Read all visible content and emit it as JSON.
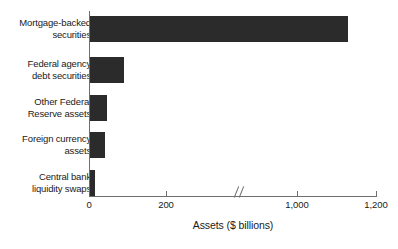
{
  "chart_data": {
    "type": "bar",
    "orientation": "horizontal",
    "title": "",
    "xlabel": "Assets ($ billions)",
    "ylabel": "",
    "categories": [
      "Mortgage-backed\nsecurities",
      "Federal agency\ndebt securities",
      "Other Federal\nReserve assets",
      "Foreign currency\nassets",
      "Central bank\nliquidity swaps"
    ],
    "values": [
      1130,
      70,
      45,
      40,
      10
    ],
    "xticks": [
      {
        "label": "0",
        "value": 0
      },
      {
        "label": "200",
        "value": 200
      },
      {
        "label": "1,000",
        "value": 1000
      },
      {
        "label": "1,200",
        "value": 1200
      }
    ],
    "xlim": [
      0,
      1200
    ],
    "axis_break": true,
    "axis_break_between": [
      200,
      1000
    ],
    "grid": false,
    "legend": null,
    "bar_color": "#2b2b2b",
    "axis_color": "#6e6e6e",
    "background_color": "#ffffff"
  },
  "layout": {
    "bar_pixels": [
      {
        "left": 90,
        "top": 16,
        "width": 258,
        "height": 26
      },
      {
        "left": 90,
        "top": 57,
        "width": 34,
        "height": 26
      },
      {
        "left": 90,
        "top": 95,
        "width": 17,
        "height": 26
      },
      {
        "left": 90,
        "top": 132,
        "width": 15,
        "height": 26
      },
      {
        "left": 90,
        "top": 170,
        "width": 5,
        "height": 26
      }
    ],
    "label_tops": [
      16,
      57,
      95,
      132,
      170
    ],
    "tick_pixels": [
      89,
      166,
      297,
      376
    ]
  }
}
